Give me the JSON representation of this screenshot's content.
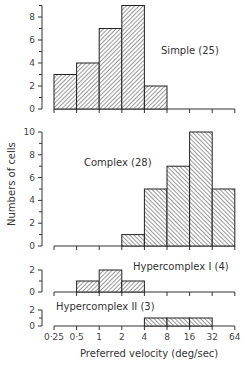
{
  "chart_data": {
    "type": "bar",
    "subtype": "histogram-stacked-panels",
    "xlabel": "Preferred velocity (deg/sec)",
    "ylabel": "Numbers of cells",
    "x_scale": "log2",
    "x_ticks": [
      "0·25",
      "0·5",
      "1",
      "2",
      "4",
      "8",
      "16",
      "32",
      "64"
    ],
    "x_tick_values": [
      0.25,
      0.5,
      1,
      2,
      4,
      8,
      16,
      32,
      64
    ],
    "bins": [
      "0.25-0.5",
      "0.5-1",
      "1-2",
      "2-4",
      "4-8",
      "8-16",
      "16-32",
      "32-64"
    ],
    "grid": false,
    "panels": [
      {
        "name": "Simple (25)",
        "hatch": "forward",
        "y_ticks": [
          0,
          2,
          4,
          6,
          8
        ],
        "ylim": [
          0,
          9
        ],
        "values": [
          3,
          4,
          7,
          9,
          2,
          0,
          0,
          0
        ]
      },
      {
        "name": "Complex (28)",
        "hatch": "backward",
        "y_ticks": [
          0,
          2,
          4,
          6,
          8,
          10
        ],
        "ylim": [
          0,
          10
        ],
        "values": [
          0,
          0,
          0,
          1,
          5,
          7,
          10,
          5
        ]
      },
      {
        "name": "Hypercomplex I (4)",
        "hatch": "forward",
        "y_ticks": [
          0,
          2
        ],
        "ylim": [
          0,
          2
        ],
        "values": [
          0,
          1,
          2,
          1,
          0,
          0,
          0,
          0
        ]
      },
      {
        "name": "Hypercomplex II (3)",
        "hatch": "backward",
        "y_ticks": [
          0,
          2
        ],
        "ylim": [
          0,
          2
        ],
        "values": [
          0,
          0,
          0,
          0,
          1,
          1,
          1,
          0
        ]
      }
    ]
  },
  "labels": {
    "simple": "Simple (25)",
    "complex": "Complex (28)",
    "hyper1": "Hypercomplex I (4)",
    "hyper2": "Hypercomplex II (3)",
    "xlabel": "Preferred velocity (deg/sec)",
    "ylabel": "Numbers of cells"
  }
}
